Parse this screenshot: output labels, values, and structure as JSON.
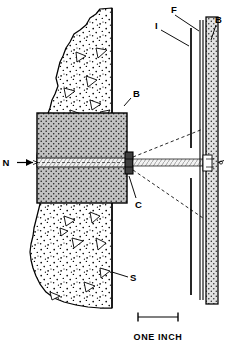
{
  "figure": {
    "kind": "line-diagram",
    "background_color": "#ffffff",
    "ink_color": "#000000"
  },
  "labels": {
    "neutron_beam": "N",
    "block_left": "B",
    "block_right": "B",
    "collimator": "C",
    "specimen": "S",
    "film": "F",
    "intensifier": "I"
  },
  "scale": {
    "caption": "ONE INCH",
    "bar_length_px": 40
  },
  "legend_meaning": {
    "N": "neutron beam direction arrow",
    "B": "boron / shielding block",
    "C": "collimator aperture",
    "S": "specimen (stippled soil/concrete section)",
    "F": "film",
    "I": "intensifier screen"
  },
  "colors": {
    "line": "#000000",
    "block_fill": "#b9b9b9",
    "strip_fill": "#dedede",
    "specimen_fill": "#ffffff",
    "aperture_fill": "#3a3a3a"
  }
}
